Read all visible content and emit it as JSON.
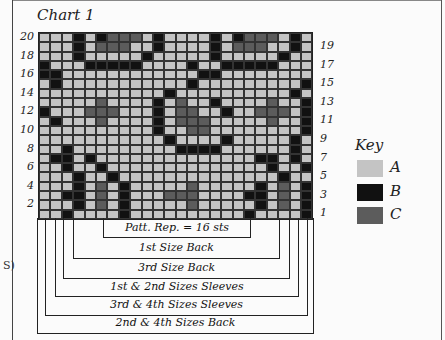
{
  "title": "Chart 1",
  "grid": {
    "columns": 24,
    "rows": 20,
    "pattern_rows_top_to_bottom": [
      "AAABABCCCABAAAABABCCCABA",
      "AAABACCCAABAAAABACCCAABA",
      "AAABAAAAABAAAAABAAAAABAA",
      "BAAABBBBBAAAABAABBBBBAAA",
      "BBAAAAAAAAAAAABBAAAAAAAA",
      "ABAAAAAAAAAAABAAAAAAAAAB",
      "AAAAAAAAAAABAAAAAAAAAABA",
      "AAAAACAAAABACAABAAAACAAB",
      "BAAACCCAAABACCAABAACCCAB",
      "ABAAACAAAABACCCAAAAACAAB",
      "AAAAAAAAAABAACCAAAAAAAAB",
      "AAAAAAAAAAABAAAABAAAAABA",
      "AABAAAAAAAAABBBBAAAAAABA",
      "ABBABAAAAAAAAAAAAAABBABA",
      "AABAABAAAAAAAAAAAAAABAAB",
      "AAABAABAAAAAAAAAAAAAABAA",
      "AAABACABAAAAACAAAAABACAB",
      "AABBACABAAACCCAAAABBACAB",
      "AAABACABAAAAACAAAAABACAB",
      "AABAAAABAAAAAAAAAABAAAAB"
    ]
  },
  "row_labels_left": [
    "20",
    "18",
    "16",
    "14",
    "12",
    "10",
    "8",
    "6",
    "4",
    "2"
  ],
  "row_labels_right": [
    "19",
    "17",
    "15",
    "13",
    "11",
    "9",
    "7",
    "5",
    "3",
    "1"
  ],
  "key": {
    "title": "Key",
    "items": [
      {
        "label": "A",
        "color": "#c4c4c4"
      },
      {
        "label": "B",
        "color": "#111111"
      },
      {
        "label": "C",
        "color": "#5c5c5c"
      }
    ]
  },
  "brackets": [
    {
      "label": "Patt. Rep. = 16 sts"
    },
    {
      "label": "1st Size Back"
    },
    {
      "label": "3rd Size Back"
    },
    {
      "label": "1st & 2nd Sizes Sleeves"
    },
    {
      "label": "3rd & 4th Sizes Sleeves"
    },
    {
      "label": "2nd & 4th Sizes Back"
    }
  ],
  "stray_text": "S)"
}
